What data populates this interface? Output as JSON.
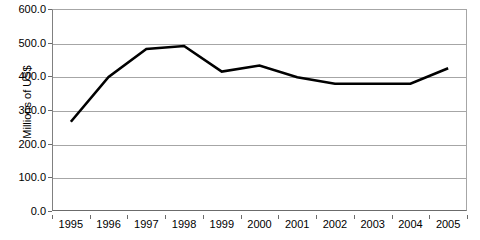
{
  "chart_data": {
    "type": "line",
    "title": "",
    "xlabel": "",
    "ylabel": "Millions of US$",
    "categories": [
      "1995",
      "1996",
      "1997",
      "1998",
      "1999",
      "2000",
      "2001",
      "2002",
      "2003",
      "2004",
      "2005"
    ],
    "values": [
      265,
      398,
      481,
      490,
      414,
      432,
      397,
      378,
      378,
      378,
      424
    ],
    "series": [
      {
        "name": "Millions of US$",
        "values": [
          265,
          398,
          481,
          490,
          414,
          432,
          397,
          378,
          378,
          378,
          424
        ]
      }
    ],
    "ylim": [
      0,
      600
    ],
    "ytick_values": [
      600,
      500,
      400,
      300,
      200,
      100,
      0
    ],
    "ytick_labels": [
      "600.0",
      "500.0",
      "400.0",
      "300.0",
      "200.0",
      "100.0",
      "0.0"
    ],
    "grid": true,
    "legend": "none",
    "line_color": "#000000",
    "gridline_color": "#a6a6a6",
    "axis_color": "#6b6b6b",
    "background_color": "#ffffff"
  }
}
